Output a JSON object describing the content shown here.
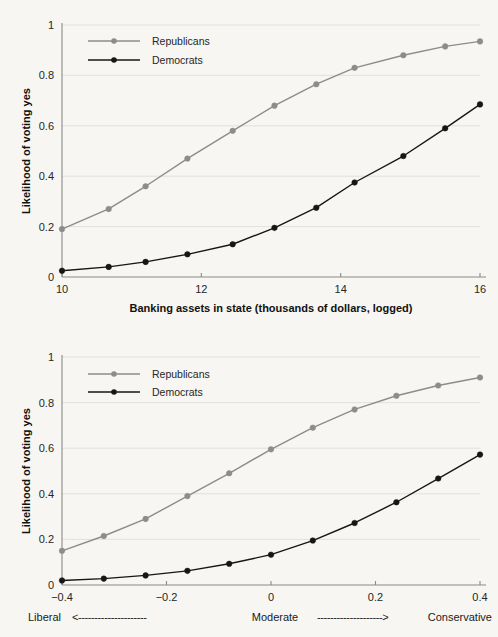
{
  "colors": {
    "background": "#f7f6f2",
    "republicans": "#8c8c8c",
    "democrats": "#161616",
    "grid": "#dcdcd6",
    "axis": "#8a8a86",
    "text": "#1a1a1a"
  },
  "chart_data": [
    {
      "id": "banking-assets-chart",
      "type": "line",
      "title": "",
      "xlabel": "Banking assets in state (thousands of dollars, logged)",
      "ylabel": "Likelihood of voting yes",
      "xlim": [
        10,
        16
      ],
      "ylim": [
        0,
        1
      ],
      "xticks": [
        10,
        12,
        14,
        16
      ],
      "xticklabels": [
        "10",
        "12",
        "14",
        "16"
      ],
      "yticks": [
        0,
        0.2,
        0.4,
        0.6,
        0.8,
        1
      ],
      "yticklabels": [
        "0",
        "0.2",
        "0.4",
        "0.6",
        "0.8",
        "1"
      ],
      "grid": true,
      "legend_position": "upper-left",
      "x": [
        10.0,
        10.67,
        11.2,
        11.8,
        12.45,
        13.05,
        13.65,
        14.2,
        14.9,
        15.5,
        16.0
      ],
      "series": [
        {
          "name": "Republicans",
          "color": "#8c8c8c",
          "values": [
            0.19,
            0.27,
            0.36,
            0.47,
            0.58,
            0.68,
            0.765,
            0.83,
            0.88,
            0.915,
            0.935
          ]
        },
        {
          "name": "Democrats",
          "color": "#161616",
          "values": [
            0.025,
            0.04,
            0.06,
            0.09,
            0.13,
            0.195,
            0.275,
            0.375,
            0.48,
            0.59,
            0.685
          ]
        }
      ]
    },
    {
      "id": "ideology-chart",
      "type": "line",
      "title": "",
      "xlabel": "",
      "ylabel": "Likelihood of voting yes",
      "xlim": [
        -0.4,
        0.4
      ],
      "ylim": [
        0,
        1
      ],
      "xticks": [
        -0.4,
        -0.2,
        0,
        0.2,
        0.4
      ],
      "xticklabels": [
        "−0.4",
        "−0.2",
        "0",
        "0.2",
        "0.4"
      ],
      "yticks": [
        0,
        0.2,
        0.4,
        0.6,
        0.8,
        1
      ],
      "yticklabels": [
        "0",
        "0.2",
        "0.4",
        "0.6",
        "0.8",
        "1"
      ],
      "grid": true,
      "legend_position": "upper-left",
      "x": [
        -0.4,
        -0.32,
        -0.24,
        -0.16,
        -0.08,
        0.0,
        0.08,
        0.16,
        0.24,
        0.32,
        0.4
      ],
      "series": [
        {
          "name": "Republicans",
          "color": "#8c8c8c",
          "values": [
            0.15,
            0.215,
            0.29,
            0.39,
            0.49,
            0.595,
            0.69,
            0.77,
            0.83,
            0.875,
            0.91
          ]
        },
        {
          "name": "Democrats",
          "color": "#161616",
          "values": [
            0.02,
            0.028,
            0.042,
            0.062,
            0.093,
            0.133,
            0.195,
            0.272,
            0.363,
            0.467,
            0.572
          ]
        }
      ],
      "scale_annotation": {
        "left_word": "Liberal",
        "left_arrow": "<",
        "left_dashes": "---------------------",
        "center_word": "Moderate",
        "right_dashes": "--------------------",
        "right_arrow": ">",
        "right_word": "Conservative"
      }
    }
  ],
  "legend": {
    "republicans": "Republicans",
    "democrats": "Democrats"
  }
}
